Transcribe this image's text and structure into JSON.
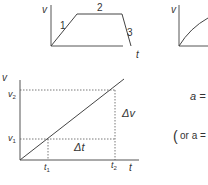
{
  "graph1": {
    "y_label": "v",
    "x_label": "t",
    "segments": [
      "1",
      "2",
      "3"
    ]
  },
  "graph2": {
    "y_label": "v"
  },
  "graph3": {
    "y_label": "v",
    "x_label": "t",
    "v1": "v",
    "v1_sub": "1",
    "v2": "v",
    "v2_sub": "2",
    "t1": "t",
    "t1_sub": "1",
    "t2": "t",
    "t2_sub": "2",
    "delta_v": "Δv",
    "delta_t": "Δt"
  },
  "formula": {
    "line1": "a =",
    "line2_open": "(",
    "line2_text": "or a ="
  },
  "colors": {
    "ink": "#333333",
    "axis": "#555555"
  }
}
